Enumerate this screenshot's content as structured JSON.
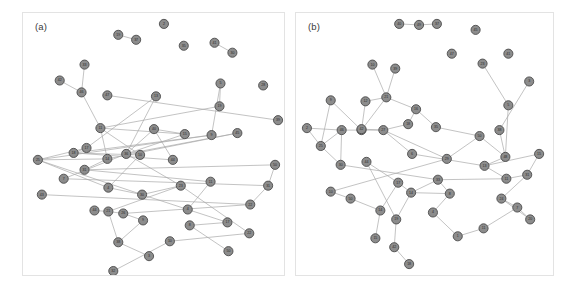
{
  "figure": {
    "background": "#ffffff",
    "node_fill": "#8c8c8c",
    "node_stroke": "#4a4a4a",
    "edge_color": "#a8a8a8",
    "panel_border": "#e3e3e3"
  },
  "panels": [
    {
      "id": "a",
      "label": "(a)",
      "chart_data": {
        "type": "scatter",
        "title": "(a)",
        "xlabel": "",
        "ylabel": "",
        "grid": false,
        "legend": "none",
        "node_count": 50,
        "edge_count": 57,
        "nodes": [
          {
            "id": 2,
            "x": 142,
            "y": 11
          },
          {
            "id": 19,
            "x": 96,
            "y": 22
          },
          {
            "id": 37,
            "x": 114,
            "y": 27
          },
          {
            "id": 35,
            "x": 162,
            "y": 33
          },
          {
            "id": 41,
            "x": 193,
            "y": 30
          },
          {
            "id": 30,
            "x": 211,
            "y": 40
          },
          {
            "id": 33,
            "x": 62,
            "y": 52
          },
          {
            "id": 42,
            "x": 37,
            "y": 68
          },
          {
            "id": 46,
            "x": 59,
            "y": 80
          },
          {
            "id": 5,
            "x": 199,
            "y": 71
          },
          {
            "id": 28,
            "x": 242,
            "y": 73
          },
          {
            "id": 47,
            "x": 85,
            "y": 83
          },
          {
            "id": 13,
            "x": 134,
            "y": 84
          },
          {
            "id": 19,
            "x": 198,
            "y": 94
          },
          {
            "id": 39,
            "x": 257,
            "y": 108
          },
          {
            "id": 11,
            "x": 78,
            "y": 116
          },
          {
            "id": 40,
            "x": 132,
            "y": 117
          },
          {
            "id": 9,
            "x": 190,
            "y": 123
          },
          {
            "id": 45,
            "x": 216,
            "y": 121
          },
          {
            "id": 15,
            "x": 163,
            "y": 122
          },
          {
            "id": 17,
            "x": 64,
            "y": 136
          },
          {
            "id": 18,
            "x": 51,
            "y": 141
          },
          {
            "id": 14,
            "x": 85,
            "y": 147
          },
          {
            "id": 36,
            "x": 104,
            "y": 142
          },
          {
            "id": 10,
            "x": 118,
            "y": 143
          },
          {
            "id": 44,
            "x": 151,
            "y": 148
          },
          {
            "id": 25,
            "x": 15,
            "y": 148
          },
          {
            "id": 50,
            "x": 254,
            "y": 153
          },
          {
            "id": 31,
            "x": 62,
            "y": 158
          },
          {
            "id": 7,
            "x": 41,
            "y": 167
          },
          {
            "id": 4,
            "x": 86,
            "y": 176
          },
          {
            "id": 23,
            "x": 159,
            "y": 174
          },
          {
            "id": 11,
            "x": 189,
            "y": 170
          },
          {
            "id": 31,
            "x": 247,
            "y": 174
          },
          {
            "id": 43,
            "x": 19,
            "y": 183
          },
          {
            "id": 30,
            "x": 120,
            "y": 183
          },
          {
            "id": 22,
            "x": 229,
            "y": 193
          },
          {
            "id": 44,
            "x": 72,
            "y": 199
          },
          {
            "id": 21,
            "x": 86,
            "y": 200
          },
          {
            "id": 26,
            "x": 101,
            "y": 202
          },
          {
            "id": 4,
            "x": 166,
            "y": 198
          },
          {
            "id": 17,
            "x": 206,
            "y": 211
          },
          {
            "id": 9,
            "x": 121,
            "y": 209
          },
          {
            "id": 8,
            "x": 168,
            "y": 214
          },
          {
            "id": 22,
            "x": 228,
            "y": 222
          },
          {
            "id": 38,
            "x": 96,
            "y": 231
          },
          {
            "id": 10,
            "x": 148,
            "y": 230
          },
          {
            "id": 3,
            "x": 127,
            "y": 245
          },
          {
            "id": 50,
            "x": 207,
            "y": 240
          },
          {
            "id": 32,
            "x": 91,
            "y": 260
          }
        ],
        "edges": [
          [
            1,
            2
          ],
          [
            4,
            5
          ],
          [
            6,
            8
          ],
          [
            7,
            8
          ],
          [
            8,
            15
          ],
          [
            9,
            13
          ],
          [
            9,
            17
          ],
          [
            11,
            14
          ],
          [
            12,
            20
          ],
          [
            12,
            23
          ],
          [
            13,
            15
          ],
          [
            15,
            19
          ],
          [
            15,
            22
          ],
          [
            15,
            24
          ],
          [
            16,
            19
          ],
          [
            16,
            23
          ],
          [
            16,
            25
          ],
          [
            17,
            21
          ],
          [
            17,
            26
          ],
          [
            18,
            22
          ],
          [
            18,
            23
          ],
          [
            19,
            23
          ],
          [
            20,
            21
          ],
          [
            20,
            26
          ],
          [
            21,
            24
          ],
          [
            22,
            26
          ],
          [
            22,
            28
          ],
          [
            23,
            31
          ],
          [
            24,
            30
          ],
          [
            25,
            21
          ],
          [
            26,
            30
          ],
          [
            26,
            35
          ],
          [
            27,
            28
          ],
          [
            28,
            32
          ],
          [
            29,
            33
          ],
          [
            30,
            35
          ],
          [
            31,
            35
          ],
          [
            31,
            38
          ],
          [
            32,
            40
          ],
          [
            33,
            36
          ],
          [
            34,
            36
          ],
          [
            35,
            40
          ],
          [
            36,
            39
          ],
          [
            37,
            38
          ],
          [
            38,
            39
          ],
          [
            39,
            42
          ],
          [
            40,
            41
          ],
          [
            41,
            43
          ],
          [
            42,
            45
          ],
          [
            43,
            48
          ],
          [
            44,
            46
          ],
          [
            45,
            47
          ],
          [
            46,
            49
          ],
          [
            23,
            29
          ],
          [
            27,
            33
          ],
          [
            31,
            44
          ],
          [
            38,
            45
          ]
        ]
      }
    },
    {
      "id": "b",
      "label": "(b)",
      "chart_data": {
        "type": "scatter",
        "title": "(b)",
        "xlabel": "",
        "ylabel": "",
        "grid": false,
        "legend": "none",
        "node_count": 50,
        "edge_count": 60,
        "nodes": [
          {
            "id": 40,
            "x": 104,
            "y": 11
          },
          {
            "id": 49,
            "x": 124,
            "y": 12
          },
          {
            "id": 37,
            "x": 142,
            "y": 11
          },
          {
            "id": 45,
            "x": 181,
            "y": 17
          },
          {
            "id": 47,
            "x": 157,
            "y": 41
          },
          {
            "id": 41,
            "x": 214,
            "y": 41
          },
          {
            "id": 23,
            "x": 188,
            "y": 51
          },
          {
            "id": 10,
            "x": 77,
            "y": 52
          },
          {
            "id": 39,
            "x": 100,
            "y": 56
          },
          {
            "id": 3,
            "x": 235,
            "y": 69
          },
          {
            "id": 21,
            "x": 91,
            "y": 85
          },
          {
            "id": 9,
            "x": 35,
            "y": 88
          },
          {
            "id": 12,
            "x": 70,
            "y": 89
          },
          {
            "id": 16,
            "x": 121,
            "y": 97
          },
          {
            "id": 5,
            "x": 214,
            "y": 93
          },
          {
            "id": 18,
            "x": 113,
            "y": 112
          },
          {
            "id": 34,
            "x": 66,
            "y": 118
          },
          {
            "id": 42,
            "x": 66,
            "y": 117
          },
          {
            "id": 35,
            "x": 141,
            "y": 115
          },
          {
            "id": 46,
            "x": 46,
            "y": 118
          },
          {
            "id": 2,
            "x": 11,
            "y": 116
          },
          {
            "id": 38,
            "x": 205,
            "y": 118
          },
          {
            "id": 27,
            "x": 88,
            "y": 118
          },
          {
            "id": 25,
            "x": 25,
            "y": 134
          },
          {
            "id": 6,
            "x": 117,
            "y": 142
          },
          {
            "id": 50,
            "x": 185,
            "y": 124
          },
          {
            "id": 48,
            "x": 211,
            "y": 145
          },
          {
            "id": 13,
            "x": 190,
            "y": 154
          },
          {
            "id": 44,
            "x": 71,
            "y": 150
          },
          {
            "id": 30,
            "x": 45,
            "y": 153
          },
          {
            "id": 29,
            "x": 152,
            "y": 147
          },
          {
            "id": 15,
            "x": 245,
            "y": 142
          },
          {
            "id": 11,
            "x": 212,
            "y": 167
          },
          {
            "id": 33,
            "x": 143,
            "y": 168
          },
          {
            "id": 17,
            "x": 103,
            "y": 171
          },
          {
            "id": 31,
            "x": 233,
            "y": 163
          },
          {
            "id": 8,
            "x": 155,
            "y": 182
          },
          {
            "id": 10,
            "x": 35,
            "y": 180
          },
          {
            "id": 14,
            "x": 116,
            "y": 181
          },
          {
            "id": 24,
            "x": 207,
            "y": 187
          },
          {
            "id": 50,
            "x": 55,
            "y": 187
          },
          {
            "id": 7,
            "x": 223,
            "y": 196
          },
          {
            "id": 14,
            "x": 85,
            "y": 199
          },
          {
            "id": 4,
            "x": 138,
            "y": 201
          },
          {
            "id": 19,
            "x": 101,
            "y": 208
          },
          {
            "id": 20,
            "x": 236,
            "y": 208
          },
          {
            "id": 11,
            "x": 189,
            "y": 217
          },
          {
            "id": 1,
            "x": 163,
            "y": 225
          },
          {
            "id": 15,
            "x": 80,
            "y": 227
          },
          {
            "id": 42,
            "x": 99,
            "y": 236
          },
          {
            "id": 18,
            "x": 114,
            "y": 253
          }
        ],
        "edges": [
          [
            0,
            1
          ],
          [
            1,
            2
          ],
          [
            7,
            10
          ],
          [
            8,
            10
          ],
          [
            10,
            12
          ],
          [
            10,
            13
          ],
          [
            10,
            16
          ],
          [
            11,
            16
          ],
          [
            12,
            16
          ],
          [
            13,
            18
          ],
          [
            13,
            15
          ],
          [
            15,
            22
          ],
          [
            16,
            19
          ],
          [
            16,
            22
          ],
          [
            18,
            25
          ],
          [
            19,
            20
          ],
          [
            19,
            23
          ],
          [
            19,
            29
          ],
          [
            20,
            23
          ],
          [
            22,
            24
          ],
          [
            22,
            30
          ],
          [
            23,
            29
          ],
          [
            25,
            26
          ],
          [
            25,
            30
          ],
          [
            26,
            27
          ],
          [
            27,
            31
          ],
          [
            27,
            32
          ],
          [
            28,
            34
          ],
          [
            29,
            33
          ],
          [
            30,
            37
          ],
          [
            31,
            35
          ],
          [
            32,
            33
          ],
          [
            32,
            35
          ],
          [
            33,
            36
          ],
          [
            33,
            38
          ],
          [
            34,
            38
          ],
          [
            34,
            42
          ],
          [
            36,
            38
          ],
          [
            36,
            43
          ],
          [
            37,
            40
          ],
          [
            38,
            44
          ],
          [
            39,
            41
          ],
          [
            40,
            42
          ],
          [
            42,
            48
          ],
          [
            43,
            47
          ],
          [
            44,
            49
          ],
          [
            45,
            41
          ],
          [
            46,
            47
          ],
          [
            49,
            50
          ],
          [
            14,
            26
          ],
          [
            17,
            22
          ],
          [
            21,
            26
          ],
          [
            24,
            27
          ],
          [
            28,
            44
          ],
          [
            35,
            39
          ],
          [
            39,
            45
          ],
          [
            41,
            46
          ],
          [
            11,
            23
          ],
          [
            9,
            21
          ],
          [
            6,
            14
          ]
        ]
      }
    }
  ]
}
